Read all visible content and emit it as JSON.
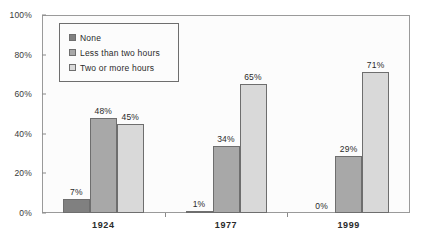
{
  "chart_data": {
    "type": "bar",
    "title": "",
    "subtitle": "",
    "xlabel": "",
    "ylabel": "",
    "categories": [
      "1924",
      "1977",
      "1999"
    ],
    "series": [
      {
        "name": "None",
        "values": [
          7,
          1,
          0
        ],
        "color": "#808080"
      },
      {
        "name": "Less than two hours",
        "values": [
          48,
          34,
          29
        ],
        "color": "#a8a8a8"
      },
      {
        "name": "Two or more hours",
        "values": [
          45,
          65,
          71
        ],
        "color": "#d9d9d9"
      }
    ],
    "value_labels": [
      [
        "7%",
        "1%",
        "0%"
      ],
      [
        "48%",
        "34%",
        "29%"
      ],
      [
        "45%",
        "65%",
        "71%"
      ]
    ],
    "ylim": [
      0,
      100
    ],
    "yticks": [
      0,
      20,
      40,
      60,
      80,
      100
    ],
    "ytick_labels": [
      "0%",
      "20%",
      "40%",
      "60%",
      "80%",
      "100%"
    ],
    "grid": false,
    "legend_position": "upper-left",
    "bar_border_color": "#6e6e6e",
    "frame_color": "#9a9a9a",
    "plot_background": "#fcfcfc"
  },
  "legend": {
    "items": [
      {
        "label": "None"
      },
      {
        "label": "Less than two hours"
      },
      {
        "label": "Two or more hours"
      }
    ]
  }
}
